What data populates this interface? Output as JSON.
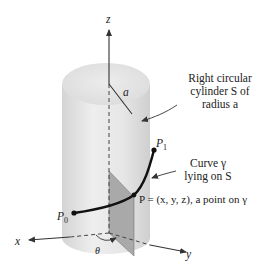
{
  "diagram": {
    "type": "3d-geometry",
    "axes": {
      "z_label": "z",
      "x_label": "x",
      "y_label": "y"
    },
    "radius_label": "a",
    "angle_label": "θ",
    "cylinder_caption": {
      "line1": "Right circular",
      "line2": "cylinder S of",
      "line3": "radius a"
    },
    "curve_caption": {
      "line1": "Curve γ",
      "line2": "lying on S"
    },
    "point_caption": "P = (x, y, z), a point on γ",
    "points": {
      "start": "P0",
      "end": "P1"
    },
    "colors": {
      "cylinder_fill": "#e4e4e4",
      "plane_fill": "#a8a8a8",
      "curve": "#111111",
      "axis": "#333333"
    }
  }
}
